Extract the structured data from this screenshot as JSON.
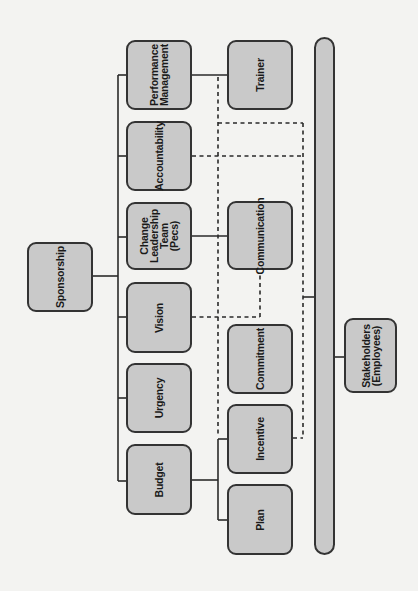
{
  "diagram": {
    "type": "organizational change management structure",
    "orientation": "rotated 90 degrees counter-clockwise",
    "colors": {
      "background": "#f3f3f1",
      "box_fill": "#c9c9c9",
      "box_border": "#333333",
      "text": "#1a1a1a"
    },
    "root": {
      "id": "sponsorship",
      "label": "Sponsorship"
    },
    "primary_nodes": [
      {
        "id": "performance-management",
        "label": "Performance\nManagement"
      },
      {
        "id": "accountability",
        "label": "Accountability"
      },
      {
        "id": "change-leadership-team",
        "label": "Change\nLeadership\nTeam\n(Pecs)"
      },
      {
        "id": "vision",
        "label": "Vision"
      },
      {
        "id": "urgency",
        "label": "Urgency"
      },
      {
        "id": "budget",
        "label": "Budget"
      }
    ],
    "secondary_nodes": [
      {
        "id": "trainer",
        "label": "Trainer"
      },
      {
        "id": "communication",
        "label": "Communication"
      },
      {
        "id": "commitment",
        "label": "Commitment"
      },
      {
        "id": "incentive",
        "label": "Incentive"
      },
      {
        "id": "plan",
        "label": "Plan"
      }
    ],
    "stakeholders_bar": {
      "id": "stakeholders-bar",
      "label": ""
    },
    "stakeholders": {
      "id": "stakeholders",
      "label": "Stakeholders\n(Employees)"
    },
    "edges": [
      {
        "from": "sponsorship",
        "to": "performance-management",
        "style": "solid"
      },
      {
        "from": "sponsorship",
        "to": "accountability",
        "style": "solid"
      },
      {
        "from": "sponsorship",
        "to": "change-leadership-team",
        "style": "solid"
      },
      {
        "from": "sponsorship",
        "to": "vision",
        "style": "solid"
      },
      {
        "from": "sponsorship",
        "to": "urgency",
        "style": "solid"
      },
      {
        "from": "sponsorship",
        "to": "budget",
        "style": "solid"
      },
      {
        "from": "performance-management",
        "to": "trainer",
        "style": "solid"
      },
      {
        "from": "change-leadership-team",
        "to": "communication",
        "style": "solid"
      },
      {
        "from": "budget",
        "to": "incentive",
        "style": "solid"
      },
      {
        "from": "budget",
        "to": "plan",
        "style": "solid"
      },
      {
        "from": "performance-management",
        "to": "incentive",
        "style": "dashed"
      },
      {
        "from": "accountability",
        "to": "stakeholders-bar",
        "style": "dashed"
      },
      {
        "from": "vision",
        "to": "communication",
        "style": "dashed"
      },
      {
        "from": "incentive",
        "to": "stakeholders-bar",
        "style": "dashed"
      },
      {
        "from": "stakeholders-bar",
        "to": "stakeholders",
        "style": "solid"
      }
    ]
  }
}
